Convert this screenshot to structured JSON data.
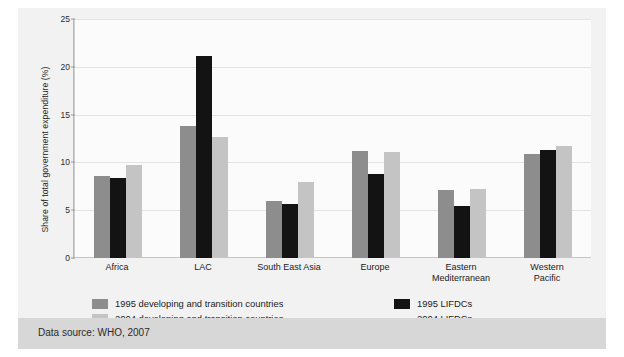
{
  "figure": {
    "top_caption": "",
    "footer": "Data source: WHO, 2007"
  },
  "legend": {
    "items": [
      {
        "label": "1995 developing and transition countries",
        "swatch": "swatch-medium-gray",
        "color": "#8d8d8d"
      },
      {
        "label": "1995 LIFDCs",
        "swatch": "swatch-black",
        "color": "#131313"
      },
      {
        "label": "2004 developing and transition countries",
        "swatch": "swatch-light-gray",
        "color": "#c4c4c4"
      },
      {
        "label": "2004 LIFDCs",
        "swatch": "swatch-none",
        "color": "transparent"
      }
    ]
  },
  "chart_data": {
    "type": "bar",
    "title": "",
    "xlabel": "",
    "ylabel": "Share of total government expenditure (%)",
    "ylim": [
      0,
      25
    ],
    "yticks": [
      "0",
      "5",
      "10",
      "15",
      "20",
      "25"
    ],
    "grid": true,
    "legend_position": "below",
    "categories": [
      "Africa",
      "LAC",
      "South East Asia",
      "Europe",
      "Eastern\nMediterranean",
      "Western\nPacific"
    ],
    "category_labels": [
      [
        "Africa"
      ],
      [
        "LAC"
      ],
      [
        "South East Asia"
      ],
      [
        "Europe"
      ],
      [
        "Eastern",
        "Mediterranean"
      ],
      [
        "Western",
        "Pacific"
      ]
    ],
    "series": [
      {
        "name": "1995 developing and transition countries",
        "color": "#8d8d8d",
        "values": [
          8.6,
          13.8,
          6.0,
          11.2,
          7.1,
          10.9
        ]
      },
      {
        "name": "1995 LIFDCs",
        "color": "#131313",
        "values": [
          8.4,
          21.1,
          5.7,
          8.8,
          5.4,
          11.3
        ]
      },
      {
        "name": "2004 developing and transition countries",
        "color": "#c4c4c4",
        "values": [
          9.7,
          12.7,
          7.9,
          11.1,
          7.2,
          11.7
        ]
      }
    ]
  }
}
